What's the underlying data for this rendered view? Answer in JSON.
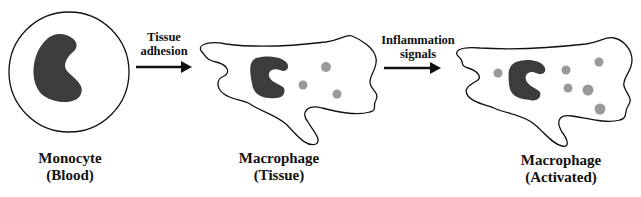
{
  "stages": [
    {
      "name": "Monocyte",
      "context": "(Blood)"
    },
    {
      "name": "Macrophage",
      "context": "(Tissue)"
    },
    {
      "name": "Macrophage",
      "context": "(Activated)"
    }
  ],
  "transitions": [
    {
      "line1": "Tissue",
      "line2": "adhesion"
    },
    {
      "line1": "Inflammation",
      "line2": "signals"
    }
  ],
  "colors": {
    "nucleus": "#3c3c3c",
    "granule": "#9a9a9a",
    "outline": "#111111"
  }
}
